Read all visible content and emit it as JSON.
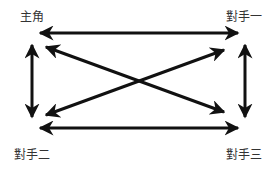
{
  "diagram": {
    "nodes": {
      "protagonist": "主角",
      "opponent1": "對手一",
      "opponent2": "對手二",
      "opponent3": "對手三"
    },
    "edges": [
      {
        "from": "主角",
        "to": "對手一",
        "direction": "both"
      },
      {
        "from": "主角",
        "to": "對手二",
        "direction": "both"
      },
      {
        "from": "主角",
        "to": "對手三",
        "direction": "both"
      },
      {
        "from": "對手一",
        "to": "對手二",
        "direction": "both"
      },
      {
        "from": "對手一",
        "to": "對手三",
        "direction": "both"
      },
      {
        "from": "對手二",
        "to": "對手三",
        "direction": "both"
      }
    ],
    "colors": {
      "arrow": "#111111",
      "text": "#333333",
      "background": "#ffffff"
    }
  }
}
